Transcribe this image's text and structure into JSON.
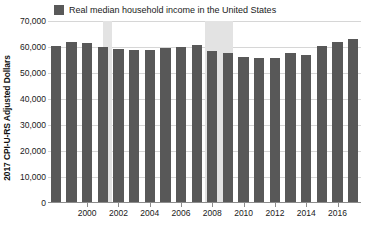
{
  "chart_data": {
    "type": "bar",
    "title": "",
    "subtitle": "",
    "xlabel": "",
    "ylabel": "2017 CPI-U-RS Adjusted Dollars",
    "ylim": [
      0,
      70000
    ],
    "ytick_labels": [
      "70,000",
      "60,000",
      "50,000",
      "40,000",
      "30,000",
      "20,000",
      "10,000",
      "0"
    ],
    "ytick_values": [
      70000,
      60000,
      50000,
      40000,
      30000,
      20000,
      10000,
      0
    ],
    "grid": true,
    "legend": {
      "position": "top-left",
      "entries": [
        {
          "label": "Real median household income in the United States",
          "color": "#595959"
        }
      ]
    },
    "categories": [
      1998,
      1999,
      2000,
      2001,
      2002,
      2003,
      2004,
      2005,
      2006,
      2007,
      2008,
      2009,
      2010,
      2011,
      2012,
      2013,
      2014,
      2015,
      2016,
      2017
    ],
    "xtick_labels": [
      "2000",
      "2002",
      "2004",
      "2006",
      "2008",
      "2010",
      "2012",
      "2014",
      "2016"
    ],
    "xtick_values": [
      2000,
      2002,
      2004,
      2006,
      2008,
      2010,
      2012,
      2014,
      2016
    ],
    "series": [
      {
        "name": "Real median household income in the United States",
        "color": "#585858",
        "values": [
          60500,
          61900,
          61400,
          60000,
          59200,
          59000,
          58900,
          59500,
          60100,
          60900,
          58500,
          57600,
          56100,
          55600,
          55900,
          57600,
          57000,
          60200,
          61800,
          63000
        ]
      }
    ],
    "annotations": [
      {
        "type": "recession-band",
        "label": "2001 recession",
        "start": 2001,
        "end": 2001.6,
        "color": "#e3e3e3"
      },
      {
        "type": "recession-band",
        "label": "2007-2009 recession",
        "start": 2007.5,
        "end": 2009.3,
        "color": "#e3e3e3"
      }
    ]
  }
}
